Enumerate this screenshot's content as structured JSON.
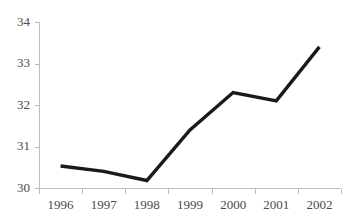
{
  "chart_data": {
    "type": "line",
    "title": "",
    "subtitle": "",
    "xlabel": "",
    "ylabel": "",
    "categories": [
      "1996",
      "1997",
      "1998",
      "1999",
      "2000",
      "2001",
      "2002"
    ],
    "series": [
      {
        "name": "",
        "values": [
          30.53,
          30.4,
          30.18,
          31.4,
          32.3,
          32.1,
          33.4
        ]
      }
    ],
    "ylim": [
      30,
      34
    ],
    "yticks": [
      30,
      31,
      32,
      33,
      34
    ],
    "ytick_labels": [
      "30",
      "31",
      "32",
      "33",
      "34"
    ],
    "grid": false,
    "legend": "none",
    "line_color": "#1a1a1a",
    "axis_color": "#bdbdbd",
    "label_color": "#4a4a4a",
    "background_color": "#ffffff"
  }
}
